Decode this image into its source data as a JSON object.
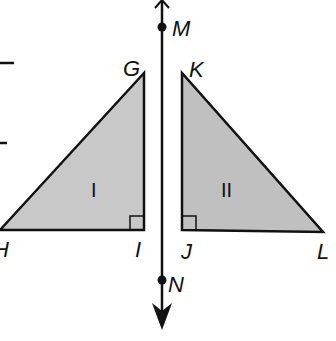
{
  "diagram": {
    "type": "reflection",
    "colors": {
      "stroke": "#111111",
      "fill": "#c8c8c8",
      "background": "#ffffff"
    },
    "line": {
      "points": [
        {
          "id": "M",
          "label": "M"
        },
        {
          "id": "N",
          "label": "N"
        }
      ]
    },
    "triangles": [
      {
        "name": "I",
        "roman": "I",
        "vertices": [
          {
            "id": "G",
            "label": "G"
          },
          {
            "id": "H",
            "label": "H"
          },
          {
            "id": "I",
            "label": "I"
          }
        ],
        "right_angle_at": "I"
      },
      {
        "name": "II",
        "roman": "II",
        "vertices": [
          {
            "id": "K",
            "label": "K"
          },
          {
            "id": "J",
            "label": "J"
          },
          {
            "id": "L",
            "label": "L"
          }
        ],
        "right_angle_at": "J"
      }
    ]
  }
}
